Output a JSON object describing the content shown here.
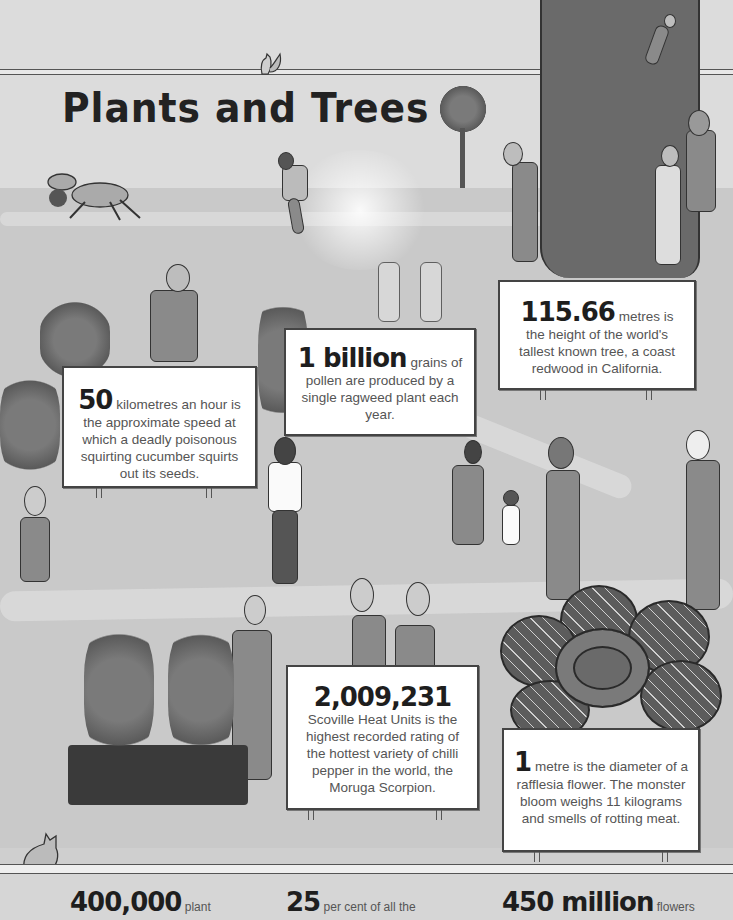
{
  "page": {
    "title": "Plants and Trees",
    "accent_colors": {
      "background": "#cfcfcf",
      "card": "#ffffff",
      "ink": "#1e1e1e",
      "body_text": "#555555"
    }
  },
  "facts": [
    {
      "id": "tree-height",
      "number": "115.66",
      "text_after": "metres is the height of the world's tallest known tree, a coast redwood in California."
    },
    {
      "id": "cucumber",
      "number": "50",
      "text_after": "kilometres an hour is the approximate speed at which a deadly poisonous squirting cucumber squirts out its seeds."
    },
    {
      "id": "pollen",
      "number": "1 billion",
      "text_after": "grains of pollen are produced by a single ragweed plant each year."
    },
    {
      "id": "chilli",
      "number": "2,009,231",
      "text_after": "Scoville Heat Units is the highest recorded rating of the hottest variety of chilli pepper in the world, the Moruga Scorpion."
    },
    {
      "id": "rafflesia",
      "number": "1",
      "text_after": "metre is the diameter of a rafflesia flower. The monster bloom weighs 11 kilograms and smells of rotting meat."
    }
  ],
  "bottom_stats": [
    {
      "number": "400,000",
      "text_after": "plant"
    },
    {
      "number": "25",
      "text_after": "per cent of all the"
    },
    {
      "number": "450 million",
      "text_after": "flowers"
    }
  ],
  "illustrations": {
    "icons": [
      "squirrel-icon",
      "goat-icon",
      "running-man-icon",
      "redwood-tree-icon",
      "small-tree-icon",
      "cucumber-plant-icon",
      "rafflesia-flower-icon",
      "bean-teepee-icon",
      "cat-icon"
    ]
  }
}
